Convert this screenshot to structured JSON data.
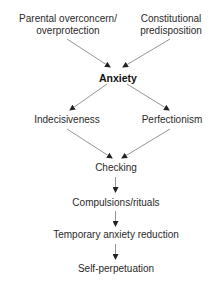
{
  "diagram": {
    "nodes": {
      "parental": {
        "line1": "Parental overconcern/",
        "line2": "overprotection"
      },
      "constitutional": {
        "line1": "Constitutional",
        "line2": "predisposition"
      },
      "anxiety": {
        "label": "Anxiety"
      },
      "indecisiveness": {
        "label": "Indecisiveness"
      },
      "perfectionism": {
        "label": "Perfectionism"
      },
      "checking": {
        "label": "Checking"
      },
      "compulsions": {
        "label": "Compulsions/rituals"
      },
      "reduction": {
        "label": "Temporary anxiety reduction"
      },
      "perpetuation": {
        "label": "Self-perpetuation"
      }
    },
    "edges": [
      {
        "from": "parental",
        "to": "anxiety"
      },
      {
        "from": "constitutional",
        "to": "anxiety"
      },
      {
        "from": "anxiety",
        "to": "indecisiveness"
      },
      {
        "from": "anxiety",
        "to": "perfectionism"
      },
      {
        "from": "indecisiveness",
        "to": "checking"
      },
      {
        "from": "perfectionism",
        "to": "checking"
      },
      {
        "from": "checking",
        "to": "compulsions"
      },
      {
        "from": "compulsions",
        "to": "reduction"
      },
      {
        "from": "reduction",
        "to": "perpetuation"
      }
    ],
    "colors": {
      "line": "#555555",
      "text": "#2a2a2a"
    }
  }
}
